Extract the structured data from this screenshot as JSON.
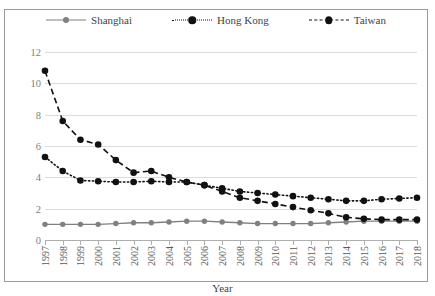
{
  "chart_data": {
    "type": "line",
    "title": "",
    "xlabel": "Year",
    "ylabel": "",
    "ylim": [
      0,
      12
    ],
    "ytick_step": 2,
    "yticks": [
      0,
      2,
      4,
      6,
      8,
      10,
      12
    ],
    "grid": true,
    "legend_position": "top",
    "categories": [
      "1997",
      "1998",
      "1999",
      "2000",
      "2001",
      "2002",
      "2003",
      "2004",
      "2005",
      "2006",
      "2007",
      "2008",
      "2009",
      "2010",
      "2011",
      "2012",
      "2013",
      "2014",
      "2015",
      "2016",
      "2017",
      "2018"
    ],
    "series": [
      {
        "name": "Shanghai",
        "color": "#808080",
        "line_style": "solid",
        "marker": "circle",
        "values": [
          1.0,
          1.0,
          1.0,
          1.0,
          1.05,
          1.1,
          1.1,
          1.15,
          1.2,
          1.2,
          1.15,
          1.1,
          1.05,
          1.05,
          1.05,
          1.05,
          1.1,
          1.15,
          1.2,
          1.2,
          1.2,
          1.2
        ]
      },
      {
        "name": "Hong Kong",
        "color": "#111111",
        "line_style": "dotted",
        "marker": "circle",
        "values": [
          5.3,
          4.4,
          3.8,
          3.75,
          3.7,
          3.7,
          3.75,
          3.7,
          3.7,
          3.5,
          3.3,
          3.1,
          3.0,
          2.9,
          2.8,
          2.7,
          2.6,
          2.5,
          2.5,
          2.6,
          2.65,
          2.7
        ]
      },
      {
        "name": "Taiwan",
        "color": "#111111",
        "line_style": "dashed",
        "marker": "circle",
        "values": [
          10.8,
          7.6,
          6.4,
          6.1,
          5.1,
          4.3,
          4.4,
          4.0,
          3.7,
          3.5,
          3.1,
          2.7,
          2.5,
          2.3,
          2.1,
          1.9,
          1.7,
          1.45,
          1.35,
          1.3,
          1.3,
          1.3
        ]
      }
    ]
  },
  "legend": {
    "items": [
      {
        "label": "Shanghai"
      },
      {
        "label": "Hong Kong"
      },
      {
        "label": "Taiwan"
      }
    ]
  },
  "axis": {
    "x_title": "Year"
  },
  "colors": {
    "shanghai": "#808080",
    "hongkong": "#111111",
    "taiwan": "#111111",
    "gridline": "#dcdcdc",
    "frame": "#9a9a9a",
    "tick_text": "#808080"
  }
}
